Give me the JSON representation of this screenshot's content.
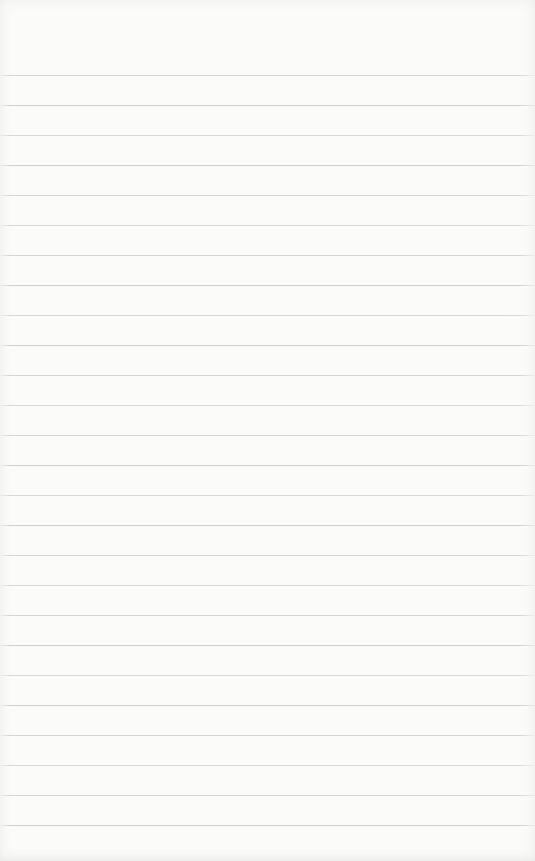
{
  "page": {
    "paper_color": "#fbfbfa",
    "line_color": "#aaaaa5",
    "line_count": 26,
    "first_line_y": 75,
    "line_spacing": 30,
    "width": 535,
    "height": 861
  }
}
